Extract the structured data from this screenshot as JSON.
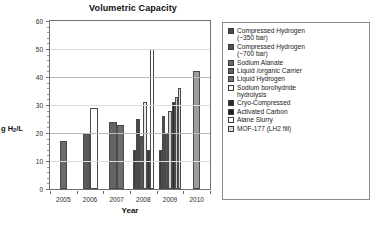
{
  "chart_data": {
    "type": "bar",
    "title": "Volumetric Capacity",
    "xlabel": "Year",
    "ylabel": "g H2/L",
    "ylabel_display": "g H₂/L",
    "ylim": [
      0,
      60
    ],
    "ytick_step": 10,
    "ytick_labels": [
      "0",
      "10",
      "20",
      "30",
      "40",
      "50",
      "60"
    ],
    "grid": true,
    "legend_position": "right",
    "categories": [
      "2005",
      "2006",
      "2007",
      "2008",
      "2009",
      "2010"
    ],
    "series": [
      {
        "name": "Compressed Hydrogen (~350 bar)",
        "swatch": "#4a4a4a",
        "points": [
          {
            "year": "2006",
            "value": 20
          },
          {
            "year": "2008",
            "value": 14
          },
          {
            "year": "2009",
            "value": 14
          }
        ]
      },
      {
        "name": "Compressed Hydrogen (~700 bar)",
        "swatch": "#555555",
        "points": [
          {
            "year": "2007",
            "value": 24
          },
          {
            "year": "2008",
            "value": 25
          },
          {
            "year": "2009",
            "value": 26
          }
        ]
      },
      {
        "name": "Sodium Alanate",
        "swatch": "#6b6b6b",
        "points": [
          {
            "year": "2005",
            "value": 17
          },
          {
            "year": "2008",
            "value": 19
          },
          {
            "year": "2009",
            "value": 20
          }
        ]
      },
      {
        "name": "Liquid /organic Carrier",
        "swatch": "#5f5f5f",
        "points": [
          {
            "year": "2007",
            "value": 23
          },
          {
            "year": "2009",
            "value": 28
          }
        ]
      },
      {
        "name": "Liquid Hydrogen",
        "swatch": "#707070",
        "points": [
          {
            "year": "2009",
            "value": 33
          }
        ]
      },
      {
        "name": "Sodium borohydride hydrolysis",
        "swatch": "#ffffff",
        "points": [
          {
            "year": "2006",
            "value": 29
          },
          {
            "year": "2008",
            "value": 31
          }
        ]
      },
      {
        "name": "Cryo-Compressed",
        "swatch": "#2b2b2b",
        "points": [
          {
            "year": "2009",
            "value": 31
          },
          {
            "year": "2010",
            "value": 42
          }
        ]
      },
      {
        "name": "Activated Carbon",
        "swatch": "#1f1f1f",
        "points": [
          {
            "year": "2009",
            "value": 22
          }
        ]
      },
      {
        "name": "Alane Slurry",
        "swatch": "#fbfbfb",
        "points": [
          {
            "year": "2008",
            "value": 50
          }
        ]
      },
      {
        "name": "MOF-177 (LH2 fill)",
        "swatch": "#d9d9d9",
        "points": [
          {
            "year": "2009",
            "value": 36
          }
        ]
      }
    ],
    "bars": [
      {
        "year": "2005",
        "value": 17,
        "fill": "#6b6b6b",
        "series": "Sodium Alanate"
      },
      {
        "year": "2006",
        "value": 20,
        "fill": "#5a5a5a",
        "series": "Compressed Hydrogen (~350 bar)"
      },
      {
        "year": "2006",
        "value": 29,
        "fill": "#fcfcfc",
        "series": "Sodium borohydride hydrolysis"
      },
      {
        "year": "2007",
        "value": 24,
        "fill": "#636363",
        "series": "Compressed Hydrogen (~700 bar)"
      },
      {
        "year": "2007",
        "value": 23,
        "fill": "#6e6e6e",
        "series": "Liquid /organic Carrier"
      },
      {
        "year": "2008",
        "value": 14,
        "fill": "#3a3a3a",
        "series": "Compressed Hydrogen (~350 bar)"
      },
      {
        "year": "2008",
        "value": 25,
        "fill": "#484848",
        "series": "Compressed Hydrogen (~700 bar)"
      },
      {
        "year": "2008",
        "value": 19,
        "fill": "#5c5c5c",
        "series": "Sodium Alanate"
      },
      {
        "year": "2008",
        "value": 31,
        "fill": "#e8e8e8",
        "series": "Sodium borohydride hydrolysis"
      },
      {
        "year": "2008",
        "value": 14,
        "fill": "#2e2e2e",
        "series": "Cryo-Compressed"
      },
      {
        "year": "2008",
        "value": 50,
        "fill": "#fefefe",
        "series": "Alane Slurry"
      },
      {
        "year": "2009",
        "value": 14,
        "fill": "#3d3d3d",
        "series": "Compressed Hydrogen (~350 bar)"
      },
      {
        "year": "2009",
        "value": 26,
        "fill": "#4f4f4f",
        "series": "Compressed Hydrogen (~700 bar)"
      },
      {
        "year": "2009",
        "value": 20,
        "fill": "#5a5a5a",
        "series": "Sodium Alanate"
      },
      {
        "year": "2009",
        "value": 28,
        "fill": "#d2d2d2",
        "series": "Liquid /organic Carrier"
      },
      {
        "year": "2009",
        "value": 31,
        "fill": "#262626",
        "series": "Cryo-Compressed"
      },
      {
        "year": "2009",
        "value": 33,
        "fill": "#c9c9c9",
        "series": "Liquid Hydrogen"
      },
      {
        "year": "2009",
        "value": 36,
        "fill": "#dcdcdc",
        "series": "MOF-177 (LH2 fill)"
      },
      {
        "year": "2010",
        "value": 42,
        "fill": "#9d9d9d",
        "series": "Cryo-Compressed"
      }
    ]
  },
  "legend": {
    "items": [
      {
        "label": "Compressed Hydrogen\n(~350 bar)",
        "swatch": "#4a4a4a"
      },
      {
        "label": "Compressed Hydrogen\n(~700 bar)",
        "swatch": "#555555"
      },
      {
        "label": "Sodium Alanate",
        "swatch": "#6b6b6b"
      },
      {
        "label": "Liquid /organic Carrier",
        "swatch": "#5f5f5f"
      },
      {
        "label": "Liquid Hydrogen",
        "swatch": "#707070"
      },
      {
        "label": "Sodium borohydride\n  hydrolysis",
        "swatch": "#ffffff"
      },
      {
        "label": "Cryo-Compressed",
        "swatch": "#2b2b2b"
      },
      {
        "label": "Activated Carbon",
        "swatch": "#1f1f1f"
      },
      {
        "label": "Alane Slurry",
        "swatch": "#ffffff"
      },
      {
        "label": "MOF-177 (LH2 fill)",
        "swatch": "#d9d9d9"
      }
    ]
  }
}
